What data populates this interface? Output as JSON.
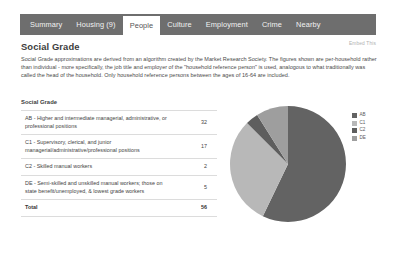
{
  "tabs": [
    {
      "label": "Summary",
      "active": false
    },
    {
      "label": "Housing (9)",
      "active": false
    },
    {
      "label": "People",
      "active": true
    },
    {
      "label": "Culture",
      "active": false
    },
    {
      "label": "Employment",
      "active": false
    },
    {
      "label": "Crime",
      "active": false
    },
    {
      "label": "Nearby",
      "active": false
    }
  ],
  "header": {
    "title": "Social Grade",
    "embed_link": "Embed This"
  },
  "description": "Social Grade approximations are derived from an algorithm created by the Market Research Society. The figures shown are per-household rather than individual - more specifically, the job title and employer of the \"household reference person\" is used, analogous to what traditionally was called the head of the household. Only household reference persons between the ages of 16-64 are included.",
  "table": {
    "heading": "Social Grade",
    "rows": [
      {
        "label": "AB - Higher and intermediate managerial, administrative, or professional positions",
        "value": "32"
      },
      {
        "label": "C1 - Supervisory, clerical, and junior managerial/administrative/professional positions",
        "value": "17"
      },
      {
        "label": "C2 - Skilled manual workers",
        "value": "2"
      },
      {
        "label": "DE - Semi-skilled and unskilled manual workers; those on state benefit/unemployed, & lowest grade workers",
        "value": "5"
      }
    ],
    "total": {
      "label": "Total",
      "value": "56"
    }
  },
  "legend": [
    {
      "label": "AB",
      "color": "#636363"
    },
    {
      "label": "C1",
      "color": "#b8b8b8"
    },
    {
      "label": "C2",
      "color": "#5e5e5e"
    },
    {
      "label": "DE",
      "color": "#9e9e9e"
    }
  ],
  "chart_data": {
    "type": "pie",
    "title": "Social Grade",
    "categories": [
      "AB",
      "C1",
      "C2",
      "DE"
    ],
    "values": [
      32,
      17,
      2,
      5
    ],
    "total": 56,
    "colors": [
      "#636363",
      "#b8b8b8",
      "#5e5e5e",
      "#9e9e9e"
    ],
    "legend_position": "right",
    "start_angle": 0,
    "direction": "clockwise"
  }
}
